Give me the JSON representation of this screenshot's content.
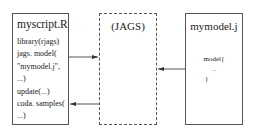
{
  "left_box": {
    "title": "myscript.R",
    "lines": [
      "library(rjags)",
      "jags. model(",
      "\"mymodel.j\",",
      "...)",
      "update(...)",
      "coda. samples(",
      "...)"
    ]
  },
  "middle_box": {
    "title": "(JAGS)",
    "style": "dashed"
  },
  "right_box": {
    "title": "mymodel.j",
    "lines": [
      "model{",
      "...",
      "}"
    ]
  },
  "arrows": [
    {
      "from": "myscript.R",
      "to": "(JAGS)",
      "y": 57
    },
    {
      "from": "mymodel.j",
      "to": "(JAGS)",
      "y": 69
    },
    {
      "from": "(JAGS)",
      "to": "myscript.R",
      "y": 104
    }
  ],
  "colors": {
    "line": "#555555",
    "text": "#222222",
    "background": "#ffffff"
  }
}
